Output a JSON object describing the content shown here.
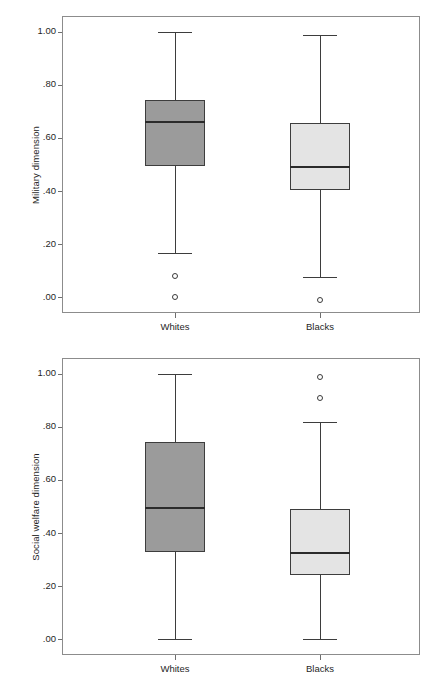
{
  "chart_data": [
    {
      "type": "boxplot",
      "title": "",
      "xlabel": "",
      "ylabel": "Military dimension",
      "categories": [
        "Whites",
        "Blacks"
      ],
      "ylim": [
        -0.06,
        1.06
      ],
      "yticks": [
        1.0,
        0.8,
        0.6,
        0.4,
        0.2,
        0.0
      ],
      "ytick_labels": [
        "1.00",
        ".80",
        ".60",
        ".40",
        ".20",
        ".00"
      ],
      "grid": false,
      "legend": "none",
      "boxes": [
        {
          "category": "Whites",
          "fill": "#9b9b9b",
          "whisker_low": 0.165,
          "q1": 0.495,
          "median": 0.66,
          "q3": 0.745,
          "whisker_high": 1.0,
          "outliers": [
            0.08,
            0.0
          ]
        },
        {
          "category": "Blacks",
          "fill": "#e4e4e4",
          "whisker_low": 0.075,
          "q1": 0.405,
          "median": 0.49,
          "q3": 0.655,
          "whisker_high": 0.99,
          "outliers": [
            -0.01
          ]
        }
      ]
    },
    {
      "type": "boxplot",
      "title": "",
      "xlabel": "",
      "ylabel": "Social welfare dimension",
      "categories": [
        "Whites",
        "Blacks"
      ],
      "ylim": [
        -0.06,
        1.06
      ],
      "yticks": [
        1.0,
        0.8,
        0.6,
        0.4,
        0.2,
        0.0
      ],
      "ytick_labels": [
        "1.00",
        ".80",
        ".60",
        ".40",
        ".20",
        ".00"
      ],
      "grid": false,
      "legend": "none",
      "boxes": [
        {
          "category": "Whites",
          "fill": "#9b9b9b",
          "whisker_low": 0.0,
          "q1": 0.33,
          "median": 0.495,
          "q3": 0.745,
          "whisker_high": 1.0,
          "outliers": []
        },
        {
          "category": "Blacks",
          "fill": "#e4e4e4",
          "whisker_low": 0.0,
          "q1": 0.24,
          "median": 0.325,
          "q3": 0.49,
          "whisker_high": 0.82,
          "outliers": [
            0.99,
            0.91
          ]
        }
      ]
    }
  ],
  "style": {
    "frame_color": "#8c8c8c",
    "box_edge_color": "#3d3d3d",
    "median_color": "#2b2b2b",
    "dark_fill": "#9b9b9b",
    "light_fill": "#e4e4e4",
    "text_color": "#1f1f1f",
    "background": "#ffffff"
  }
}
